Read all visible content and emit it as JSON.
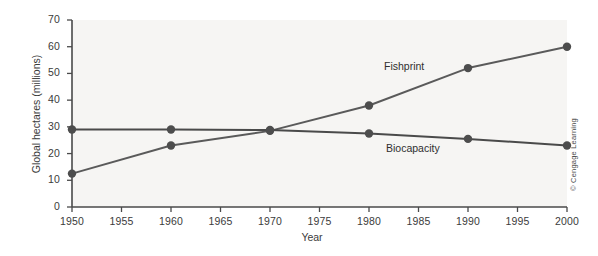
{
  "chart_data": {
    "type": "line",
    "title": "",
    "subtitle": "",
    "xlabel": "Year",
    "ylabel": "Global hectares (millions)",
    "x": [
      1950,
      1960,
      1970,
      1980,
      1990,
      2000
    ],
    "xlim": [
      1950,
      2000
    ],
    "ylim": [
      0,
      70
    ],
    "xticks": [
      1950,
      1955,
      1960,
      1965,
      1970,
      1975,
      1980,
      1985,
      1990,
      1995,
      2000
    ],
    "xtick_labels": [
      "1950",
      "1955",
      "1960",
      "1965",
      "1970",
      "1975",
      "1980",
      "1985",
      "1990",
      "1995",
      "2000"
    ],
    "yticks": [
      0,
      10,
      20,
      30,
      40,
      50,
      60,
      70
    ],
    "ytick_labels": [
      "0",
      "10",
      "20",
      "30",
      "40",
      "50",
      "60",
      "70"
    ],
    "grid": false,
    "legend_position": "inline-annotation",
    "series": [
      {
        "name": "Fishprint",
        "color": "#5a5a5a",
        "marker": "circle",
        "values": [
          12.5,
          23.0,
          28.5,
          38.0,
          52.0,
          60.0
        ]
      },
      {
        "name": "Biocapacity",
        "color": "#4a4a4a",
        "marker": "circle",
        "values": [
          29.0,
          29.0,
          28.8,
          27.5,
          25.5,
          23.0
        ]
      }
    ],
    "annotations": [
      {
        "text": "Fishprint",
        "x": 1984,
        "y": 45
      },
      {
        "text": "Biocapacity",
        "x": 1984,
        "y": 21
      }
    ]
  },
  "credit": {
    "text": "© Cengage Learning"
  },
  "colors": {
    "plot_background": "#f6f5f3",
    "axis": "#4a4a4a",
    "text": "#3b3b3b",
    "fishprint": "#5a5a5a",
    "biocapacity": "#4a4a4a",
    "marker": "#4d4d4d"
  }
}
